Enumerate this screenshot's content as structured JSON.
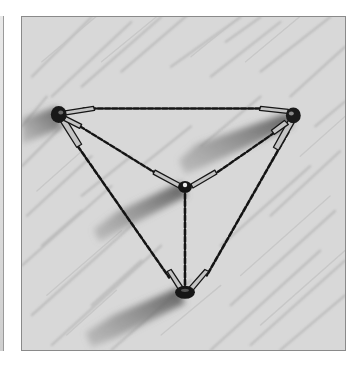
{
  "image": {
    "subject": "Pencil sketch of a tetrahedral tethered structure",
    "alt": "Pencil illustration of four nodes connected by chain tethers forming a tetrahedron, with rod segments near each node and shadows cast down-left on a hatched background",
    "colors": {
      "page": "#ffffff",
      "paper": "#d6d6d6",
      "hatch": "#b4b4b4",
      "shadow": "#6e6e6e",
      "ink": "#141414",
      "rod_fill": "#bdbdbd",
      "frame_border": "#8a8a8a"
    },
    "nodes": [
      {
        "id": "top-left",
        "x": 37,
        "y": 98
      },
      {
        "id": "top-right",
        "x": 272,
        "y": 98
      },
      {
        "id": "center",
        "x": 164,
        "y": 170
      },
      {
        "id": "bottom",
        "x": 164,
        "y": 276
      }
    ],
    "tethers": [
      {
        "from": "top-left",
        "to": "top-right"
      },
      {
        "from": "top-left",
        "to": "center"
      },
      {
        "from": "top-right",
        "to": "center"
      },
      {
        "from": "top-left",
        "to": "bottom"
      },
      {
        "from": "top-right",
        "to": "bottom"
      },
      {
        "from": "center",
        "to": "bottom"
      }
    ]
  }
}
